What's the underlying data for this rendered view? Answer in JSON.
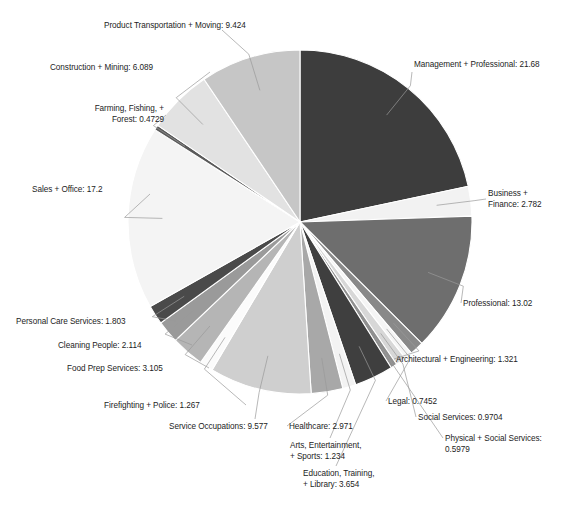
{
  "chart_data": {
    "type": "pie",
    "title": "",
    "subtitle": "",
    "xlabel": "",
    "ylabel": "",
    "legend_position": "none",
    "grid": false,
    "label_format": "{name}: {value}",
    "start_angle_deg": 0,
    "direction": "clockwise",
    "categories": [
      "Management + Professional",
      "Business + Finance",
      "Professional",
      "Architectural + Engineering",
      "Legal",
      "Social Services",
      "Physical + Social Services",
      "Education, Training, + Library",
      "Arts, Entertainment, + Sports",
      "Healthcare",
      "Service Occupations",
      "Firefighting + Police",
      "Food Prep Services",
      "Cleaning People",
      "Personal Care Services",
      "Sales + Office",
      "Farming, Fishing, + Forest",
      "Construction + Mining",
      "Product Transportation + Moving"
    ],
    "values": [
      21.68,
      2.782,
      13.02,
      1.321,
      0.7452,
      0.9704,
      0.5979,
      3.654,
      1.234,
      2.971,
      9.577,
      1.267,
      3.105,
      2.114,
      1.803,
      17.2,
      0.4729,
      6.089,
      9.424
    ],
    "colors": [
      "#3d3d3d",
      "#f2f2f2",
      "#6e6e6e",
      "#898989",
      "#f5f5f5",
      "#d7d7d7",
      "#8f8f8f",
      "#3f3f3f",
      "#f3f3f3",
      "#a8a8a8",
      "#cfcfcf",
      "#fbfbfb",
      "#b5b5b5",
      "#9a9a9a",
      "#4a4a4a",
      "#f4f4f4",
      "#5a5a5a",
      "#e2e2e2",
      "#c6c6c6"
    ]
  },
  "labels": [
    {
      "text": "Management + Professional: 21.68"
    },
    {
      "text": "Business +\nFinance: 2.782"
    },
    {
      "text": "Professional: 13.02"
    },
    {
      "text": "Architectural + Engineering: 1.321"
    },
    {
      "text": "Legal: 0.7452"
    },
    {
      "text": "Social Services: 0.9704"
    },
    {
      "text": "Physical + Social Services:\n0.5979"
    },
    {
      "text": "Education, Training,\n+ Library: 3.654"
    },
    {
      "text": "Arts, Entertainment,\n+ Sports: 1.234"
    },
    {
      "text": "Healthcare: 2.971"
    },
    {
      "text": "Service Occupations: 9.577"
    },
    {
      "text": "Firefighting + Police: 1.267"
    },
    {
      "text": "Food Prep Services: 3.105"
    },
    {
      "text": "Cleaning People: 2.114"
    },
    {
      "text": "Personal Care Services: 1.803"
    },
    {
      "text": "Sales + Office: 17.2"
    },
    {
      "text": "Farming, Fishing, +\nForest: 0.4729"
    },
    {
      "text": "Construction + Mining: 6.089"
    },
    {
      "text": "Product Transportation + Moving: 9.424"
    }
  ],
  "geometry": {
    "center_x": 300,
    "center_y": 222,
    "radius": 172
  }
}
